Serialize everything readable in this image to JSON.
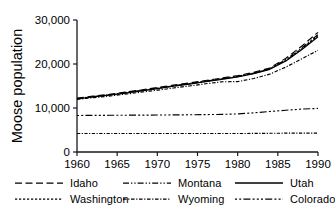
{
  "chart_data": {
    "type": "line",
    "title": "",
    "xlabel": "",
    "ylabel": "Moose population",
    "xlim": [
      1960,
      1990
    ],
    "ylim": [
      0,
      30000
    ],
    "xticks": [
      1960,
      1965,
      1970,
      1975,
      1980,
      1985,
      1990
    ],
    "xticklabels": [
      "1960",
      "1965",
      "1970",
      "1975",
      "1980",
      "1985",
      "1990"
    ],
    "yticks": [
      0,
      10000,
      20000,
      30000
    ],
    "yticklabels": [
      "0",
      "10,000",
      "20,000",
      "30,000"
    ],
    "grid": false,
    "legend_position": "below",
    "x": [
      1960,
      1962,
      1964,
      1966,
      1968,
      1970,
      1972,
      1974,
      1976,
      1978,
      1980,
      1982,
      1984,
      1986,
      1988,
      1990
    ],
    "series": [
      {
        "name": "Idaho",
        "linestyle": "dashed",
        "color": "#000000",
        "values": [
          12250,
          12700,
          13100,
          13600,
          14100,
          14650,
          15200,
          15700,
          16250,
          16800,
          17350,
          18100,
          19100,
          21300,
          24100,
          27200
        ]
      },
      {
        "name": "Montana",
        "linestyle": "dash-dot-dot",
        "color": "#000000",
        "values": [
          12150,
          12600,
          13000,
          13500,
          14000,
          14500,
          15050,
          15550,
          16100,
          16650,
          17200,
          17950,
          18950,
          21000,
          23700,
          26700
        ]
      },
      {
        "name": "Utah",
        "linestyle": "solid",
        "color": "#000000",
        "values": [
          12050,
          12500,
          12900,
          13400,
          13900,
          14400,
          14950,
          15450,
          16000,
          16500,
          17050,
          17800,
          18800,
          20700,
          23300,
          26200
        ]
      },
      {
        "name": "Washington",
        "linestyle": "dotted",
        "color": "#000000",
        "values": [
          12100,
          12550,
          12950,
          13450,
          13950,
          14450,
          15000,
          15500,
          16050,
          16600,
          17100,
          17870,
          18870,
          20850,
          23500,
          26450
        ]
      },
      {
        "name": "Wyoming",
        "linestyle": "dash-dot-dense",
        "color": "#000000",
        "values": [
          11950,
          12350,
          12700,
          13150,
          13600,
          14050,
          14550,
          15000,
          15500,
          15950,
          16000,
          16700,
          17700,
          19300,
          21200,
          23100
        ]
      },
      {
        "name": "Colorado",
        "linestyle": "dash-dot",
        "color": "#000000",
        "values": [
          8300,
          8320,
          8340,
          8360,
          8380,
          8400,
          8430,
          8460,
          8500,
          8550,
          8650,
          8900,
          9200,
          9500,
          9750,
          9900
        ]
      },
      {
        "name": "Idaho-lower",
        "linestyle": "dashed-low",
        "color": "#000000",
        "values": [
          4200,
          4200,
          4200,
          4200,
          4200,
          4200,
          4200,
          4200,
          4200,
          4200,
          4200,
          4220,
          4250,
          4280,
          4300,
          4300
        ]
      }
    ],
    "legend": [
      {
        "label": "Idaho",
        "style": "dashed"
      },
      {
        "label": "Montana",
        "style": "dash-dot-dot"
      },
      {
        "label": "Utah",
        "style": "solid"
      },
      {
        "label": "Washington",
        "style": "dotted"
      },
      {
        "label": "Wyoming",
        "style": "dash-dot-dense"
      },
      {
        "label": "Colorado",
        "style": "dash-dot"
      }
    ]
  }
}
